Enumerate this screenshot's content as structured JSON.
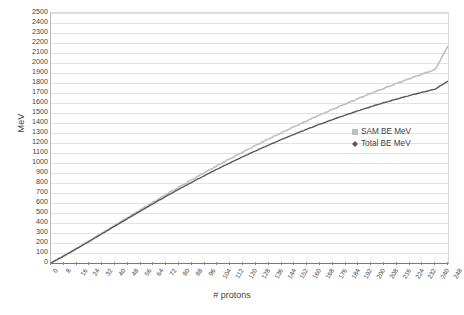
{
  "chart_data": {
    "type": "line",
    "title": "",
    "xlabel": "# protons",
    "ylabel": "MeV",
    "xlim": [
      0,
      248
    ],
    "ylim": [
      0,
      2500
    ],
    "ytick_step": 100,
    "xtick_step": 8,
    "grid": true,
    "legend_position": "right-middle",
    "xticks": [
      0,
      8,
      16,
      24,
      32,
      40,
      48,
      56,
      64,
      72,
      80,
      88,
      96,
      104,
      112,
      120,
      128,
      136,
      144,
      152,
      160,
      168,
      176,
      184,
      192,
      200,
      208,
      216,
      224,
      232,
      240,
      248
    ],
    "yticks": [
      0,
      100,
      200,
      300,
      400,
      500,
      600,
      700,
      800,
      900,
      1000,
      1100,
      1200,
      1300,
      1400,
      1500,
      1600,
      1700,
      1800,
      1900,
      2000,
      2100,
      2200,
      2300,
      2400,
      2500
    ],
    "series": [
      {
        "name": "SAM BE MeV",
        "color": "#bfbfbf",
        "marker": "square",
        "x": [
          0,
          8,
          16,
          24,
          32,
          40,
          48,
          56,
          64,
          72,
          80,
          88,
          96,
          104,
          112,
          120,
          128,
          136,
          144,
          152,
          160,
          168,
          176,
          184,
          192,
          200,
          208,
          216,
          224,
          232,
          240,
          248
        ],
        "values": [
          0,
          72,
          146,
          222,
          300,
          378,
          456,
          533,
          610,
          686,
          760,
          833,
          905,
          975,
          1044,
          1111,
          1177,
          1241,
          1303,
          1364,
          1423,
          1481,
          1537,
          1592,
          1645,
          1697,
          1747,
          1796,
          1844,
          1890,
          1935,
          2170
        ]
      },
      {
        "name": "Total BE MeV",
        "color": "#595959",
        "marker": "diamond",
        "x": [
          0,
          8,
          16,
          24,
          32,
          40,
          48,
          56,
          64,
          72,
          80,
          88,
          96,
          104,
          112,
          120,
          128,
          136,
          144,
          152,
          160,
          168,
          176,
          184,
          192,
          200,
          208,
          216,
          224,
          232,
          240,
          248
        ],
        "values": [
          0,
          70,
          143,
          218,
          294,
          370,
          446,
          521,
          595,
          668,
          739,
          808,
          875,
          940,
          1003,
          1064,
          1123,
          1180,
          1235,
          1288,
          1339,
          1388,
          1435,
          1480,
          1523,
          1564,
          1603,
          1640,
          1675,
          1708,
          1739,
          1820
        ]
      }
    ]
  },
  "legend": {
    "items": [
      {
        "label": "SAM BE MeV",
        "marker": "square-marker",
        "color": "#bfbfbf"
      },
      {
        "label": "Total BE MeV",
        "marker": "diamond-marker",
        "color": "#595959"
      }
    ]
  },
  "axes": {
    "y_title": "MeV",
    "x_title": "# protons"
  }
}
